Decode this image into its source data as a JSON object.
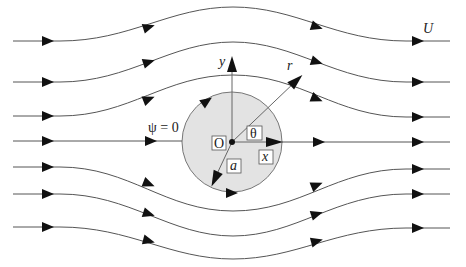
{
  "diagram": {
    "labels": {
      "free_stream": "U",
      "stagnation_streamline": "ψ = 0",
      "origin": "O",
      "angle": "θ",
      "x_axis": "x",
      "y_axis": "y",
      "radial": "r",
      "radius": "a"
    },
    "colors": {
      "cylinder_fill": "#e3e3e3",
      "cylinder_stroke": "#777777",
      "streamline": "#555555",
      "arrow": "#111111"
    },
    "cylinder": {
      "cx": 232,
      "cy": 142,
      "r": 50
    },
    "streamline_count": 7,
    "flow_direction": "left-to-right"
  }
}
